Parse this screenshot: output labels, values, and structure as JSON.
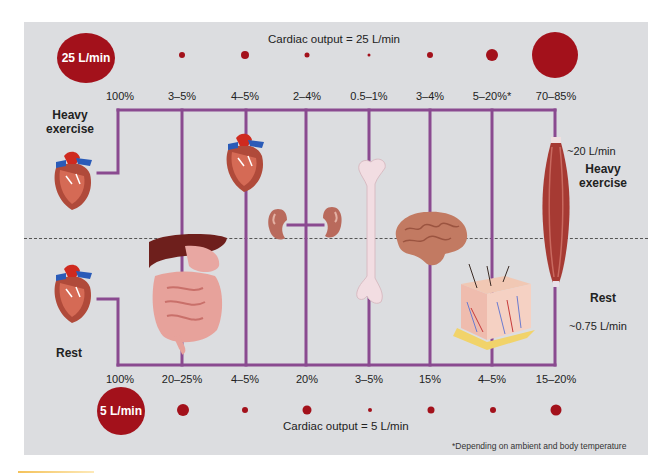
{
  "diagram": {
    "title_top": "Cardiac output = 25 L/min",
    "title_bottom": "Cardiac output = 5 L/min",
    "total_top": "25 L/min",
    "total_bottom": "5 L/min",
    "state_top_label": "Heavy exercise",
    "state_bottom_label": "Rest",
    "right_top_label": "Heavy exercise",
    "right_bottom_label": "Rest",
    "muscle_flow_exercise": "~20 L/min",
    "muscle_flow_rest": "~0.75 L/min",
    "footnote": "*Depending on ambient and body temperature",
    "colors": {
      "flow_dot": "#a3111b",
      "vessel_line": "#8a4a90",
      "panel_bg": "#dcdde0"
    },
    "organs": [
      {
        "name": "Heart (total)",
        "icon": "heart-icon",
        "exercise_pct": "100%",
        "rest_pct": "100%"
      },
      {
        "name": "Digestive tract & liver",
        "icon": "digestive-icon",
        "exercise_pct": "3–5%",
        "rest_pct": "20–25%"
      },
      {
        "name": "Heart (coronary)",
        "icon": "heart-icon",
        "exercise_pct": "4–5%",
        "rest_pct": "4–5%"
      },
      {
        "name": "Kidneys",
        "icon": "kidneys-icon",
        "exercise_pct": "2–4%",
        "rest_pct": "20%"
      },
      {
        "name": "Bone",
        "icon": "bone-icon",
        "exercise_pct": "0.5–1%",
        "rest_pct": "3–5%"
      },
      {
        "name": "Brain",
        "icon": "brain-icon",
        "exercise_pct": "3–4%",
        "rest_pct": "15%"
      },
      {
        "name": "Skin",
        "icon": "skin-icon",
        "exercise_pct": "5–20%*",
        "rest_pct": "4–5%"
      },
      {
        "name": "Skeletal muscle",
        "icon": "muscle-icon",
        "exercise_pct": "70–85%",
        "rest_pct": "15–20%"
      }
    ]
  }
}
